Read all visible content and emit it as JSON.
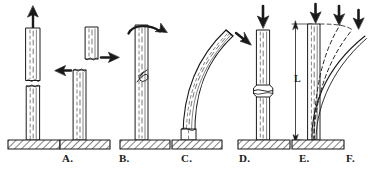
{
  "figure": {
    "background_color": "#ffffff",
    "ink_color": "#1a1a1a",
    "width": 368,
    "height": 170
  },
  "panels": [
    {
      "id": "a",
      "caption": "A.",
      "failure_mode": "tension",
      "load_icon": "up-arrow-icon",
      "load_direction": "up",
      "description": "Column pulled apart in tension; clean transverse break near mid-height.",
      "caption_x": 62,
      "caption_y": 153
    },
    {
      "id": "b",
      "caption": "B.",
      "failure_mode": "shear",
      "load_icon": "opposing-horizontal-arrows-icon",
      "load_direction": "opposed-horizontal",
      "description": "Upper segment displaced sideways relative to lower segment; shear break.",
      "caption_x": 120,
      "caption_y": 153
    },
    {
      "id": "c",
      "caption": "C.",
      "failure_mode": "torsion",
      "load_icon": "curved-rotation-arrow-icon",
      "load_direction": "twist-clockwise",
      "description": "Column twisted about its axis; helical spiral crack forms.",
      "caption_x": 182,
      "caption_y": 153
    },
    {
      "id": "d",
      "caption": "D.",
      "failure_mode": "bending",
      "load_icon": "diagonal-arrow-icon",
      "load_direction": "diagonal-down-right",
      "description": "Lateral load bends the column into a curve; base splits.",
      "caption_x": 240,
      "caption_y": 153
    },
    {
      "id": "e",
      "caption": "E.",
      "failure_mode": "compression",
      "load_icon": "down-arrow-icon",
      "load_direction": "down",
      "description": "Axial compression crushes the column; bulged crush band at mid-height.",
      "caption_x": 300,
      "caption_y": 153
    },
    {
      "id": "f",
      "caption": "F.",
      "failure_mode": "buckling",
      "load_icon": "down-arrow-icon",
      "load_direction": "down",
      "description": "Slender column of length L buckles progressively under increasing axial load.",
      "caption_x": 347,
      "caption_y": 153,
      "dimension_label": "L",
      "dimension_label_x": 297,
      "dimension_label_y": 79,
      "arrow_count": 3,
      "deflection_curves": 3
    }
  ]
}
